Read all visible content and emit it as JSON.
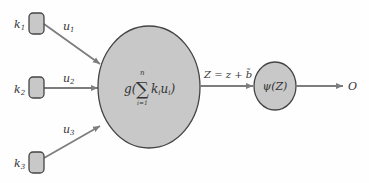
{
  "inputs": [
    {
      "weight": "k",
      "weight_sub": "1",
      "signal": "u",
      "signal_sub": "1"
    },
    {
      "weight": "k",
      "weight_sub": "2",
      "signal": "u",
      "signal_sub": "2"
    },
    {
      "weight": "k",
      "weight_sub": "3",
      "signal": "u",
      "signal_sub": "3"
    }
  ],
  "summation": {
    "func": "g(",
    "sigma": "∑",
    "upper": "n",
    "lower": "i=1",
    "term": "k",
    "term_sub": "i",
    "term2": "u",
    "term2_sub": "i",
    "close": ")"
  },
  "bias_label": "Z = z + b̃",
  "activation": "ψ(Z)",
  "output": "O",
  "colors": {
    "node_fill": "#c8c8c8",
    "node_stroke": "#444444",
    "arrow": "#7d7d7d"
  }
}
